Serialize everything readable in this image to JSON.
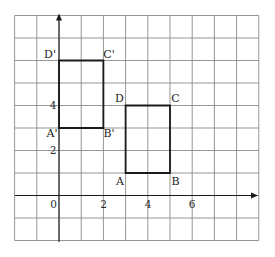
{
  "diagram": {
    "type": "coordinate-grid-translation",
    "grid": {
      "x_min": -2,
      "x_max": 9,
      "y_min": -2,
      "y_max": 8,
      "origin_px": [
        59,
        195.5
      ],
      "cell_px": [
        22.2,
        22.5
      ],
      "line_color": "#8a8a8a"
    },
    "axes": {
      "x_tick_labels": [
        {
          "value": 0,
          "text": "0"
        },
        {
          "value": 2,
          "text": "2"
        },
        {
          "value": 4,
          "text": "4"
        },
        {
          "value": 6,
          "text": "6"
        }
      ],
      "y_tick_labels": [
        {
          "value": 2,
          "text": "2"
        },
        {
          "value": 4,
          "text": "4"
        }
      ],
      "color": "#1a1a1a"
    },
    "shapes": [
      {
        "name": "ABCD",
        "vertices": [
          {
            "label": "A",
            "x": 3,
            "y": 1
          },
          {
            "label": "B",
            "x": 5,
            "y": 1
          },
          {
            "label": "C",
            "x": 5,
            "y": 4
          },
          {
            "label": "D",
            "x": 3,
            "y": 4
          }
        ]
      },
      {
        "name": "A'B'C'D'",
        "vertices": [
          {
            "label": "A'",
            "x": 0,
            "y": 3
          },
          {
            "label": "B'",
            "x": 2,
            "y": 3
          },
          {
            "label": "C'",
            "x": 2,
            "y": 6
          },
          {
            "label": "D'",
            "x": 0,
            "y": 6
          }
        ]
      }
    ]
  }
}
